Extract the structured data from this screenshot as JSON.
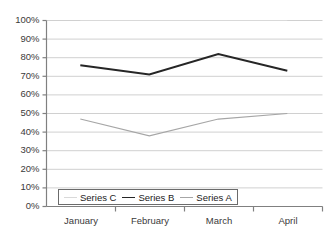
{
  "chart_data": {
    "type": "line",
    "title": "",
    "xlabel": "",
    "ylabel": "",
    "categories": [
      "January",
      "February",
      "March",
      "April"
    ],
    "ylim": [
      0,
      100
    ],
    "y_ticks": [
      "0%",
      "10%",
      "20%",
      "30%",
      "40%",
      "50%",
      "60%",
      "70%",
      "80%",
      "90%",
      "100%"
    ],
    "y_tick_values": [
      0,
      10,
      20,
      30,
      40,
      50,
      60,
      70,
      80,
      90,
      100
    ],
    "grid": true,
    "grid_axis": "y",
    "legend_position": "bottom-left-inside",
    "series": [
      {
        "name": "Series C",
        "color": "#d9d9d9",
        "values": [
          100,
          100,
          100,
          100
        ],
        "note": "near-invisible light line along the 100% gridline"
      },
      {
        "name": "Series B",
        "color": "#262626",
        "values": [
          76,
          71,
          82,
          73
        ]
      },
      {
        "name": "Series A",
        "color": "#a6a6a6",
        "values": [
          47,
          38,
          47,
          50
        ]
      }
    ]
  },
  "axes": {
    "axis_color": "#808080",
    "grid_color": "#d0d0d0"
  },
  "legend": {
    "entries": [
      {
        "label": "Series C",
        "color": "#d9d9d9"
      },
      {
        "label": "Series B",
        "color": "#262626"
      },
      {
        "label": "Series A",
        "color": "#a6a6a6"
      }
    ]
  }
}
